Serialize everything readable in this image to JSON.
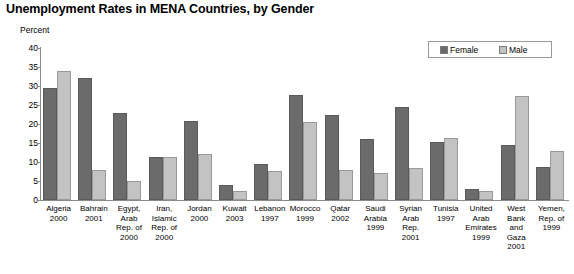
{
  "chart_data": {
    "type": "bar",
    "title": "Unemployment Rates in MENA Countries, by Gender",
    "xlabel": "",
    "ylabel": "Percent",
    "ylim": [
      0,
      40
    ],
    "yticks": [
      0,
      5,
      10,
      15,
      20,
      25,
      30,
      35,
      40
    ],
    "grid": false,
    "legend_position": "top-right",
    "categories": [
      "Algeria 2000",
      "Bahrain 2001",
      "Egypt, Arab Rep. of 2000",
      "Iran, Islamic Rep. of 2000",
      "Jordan 2000",
      "Kuwait 2003",
      "Lebanon 1997",
      "Morocco 1999",
      "Qatar 2002",
      "Saudi Arabia 1999",
      "Syrian Arab Rep. 2001",
      "Tunisia 1997",
      "United Arab Emirates 1999",
      "West Bank and Gaza 2001",
      "Yemen, Rep. of 1999"
    ],
    "series": [
      {
        "name": "Female",
        "color": "#6b6b6b",
        "values": [
          29.6,
          32.0,
          22.9,
          11.2,
          20.9,
          4.0,
          9.5,
          27.6,
          22.5,
          16.0,
          24.4,
          15.3,
          2.8,
          14.6,
          8.7
        ]
      },
      {
        "name": "Male",
        "color": "#c3c3c3",
        "values": [
          34.0,
          7.9,
          5.1,
          11.4,
          12.0,
          2.3,
          7.6,
          20.6,
          7.9,
          7.2,
          8.4,
          16.2,
          2.4,
          27.5,
          12.9
        ]
      }
    ]
  },
  "axis": {
    "unit_label": "Percent"
  },
  "category_lines": [
    [
      "Algeria",
      "2000"
    ],
    [
      "Bahrain",
      "2001"
    ],
    [
      "Egypt,",
      "Arab",
      "Rep. of",
      "2000"
    ],
    [
      "Iran,",
      "Islamic",
      "Rep. of",
      "2000"
    ],
    [
      "Jordan",
      "2000"
    ],
    [
      "Kuwait",
      "2003"
    ],
    [
      "Lebanon",
      "1997"
    ],
    [
      "Morocco",
      "1999"
    ],
    [
      "Qatar",
      "2002"
    ],
    [
      "Saudi",
      "Arabia",
      "1999"
    ],
    [
      "Syrian",
      "Arab",
      "Rep.",
      "2001"
    ],
    [
      "Tunisia",
      "1997"
    ],
    [
      "United",
      "Arab",
      "Emirates",
      "1999"
    ],
    [
      "West",
      "Bank",
      "and",
      "Gaza",
      "2001"
    ],
    [
      "Yemen,",
      "Rep. of",
      "1999"
    ]
  ]
}
